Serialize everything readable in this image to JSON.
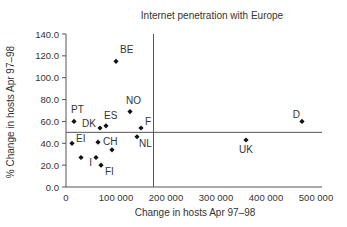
{
  "chart_data": {
    "type": "scatter",
    "title": "Internet penetration with Europe",
    "xlabel": "Change in hosts Apr 97–98",
    "ylabel": "% Change in hosts Apr 97–98",
    "xlim": [
      0,
      500000
    ],
    "ylim": [
      0,
      140
    ],
    "x_ticks": [
      "0",
      "100 000",
      "200 000",
      "300 000",
      "400 000",
      "500 000"
    ],
    "y_ticks": [
      "0.0",
      "20.0",
      "40.0",
      "60.0",
      "80.0",
      "100.0",
      "120.0",
      "140.0"
    ],
    "grid": false,
    "reference_lines": {
      "vertical_x": 175000,
      "horizontal_y": 50
    },
    "points": [
      {
        "label": "BE",
        "x": 100000,
        "y": 115
      },
      {
        "label": "PT",
        "x": 16000,
        "y": 60
      },
      {
        "label": "DK",
        "x": 68000,
        "y": 54
      },
      {
        "label": "ES",
        "x": 80000,
        "y": 56
      },
      {
        "label": "NO",
        "x": 128000,
        "y": 69
      },
      {
        "label": "F",
        "x": 150000,
        "y": 54
      },
      {
        "label": "NL",
        "x": 142000,
        "y": 46
      },
      {
        "label": "EI",
        "x": 12000,
        "y": 40
      },
      {
        "label": "CH",
        "x": 64000,
        "y": 41
      },
      {
        "label": "",
        "x": 92000,
        "y": 34
      },
      {
        "label": "",
        "x": 30000,
        "y": 27
      },
      {
        "label": "I",
        "x": 60000,
        "y": 27
      },
      {
        "label": "FI",
        "x": 70000,
        "y": 20
      },
      {
        "label": "UK",
        "x": 360000,
        "y": 43
      },
      {
        "label": "D",
        "x": 472000,
        "y": 60
      }
    ]
  }
}
